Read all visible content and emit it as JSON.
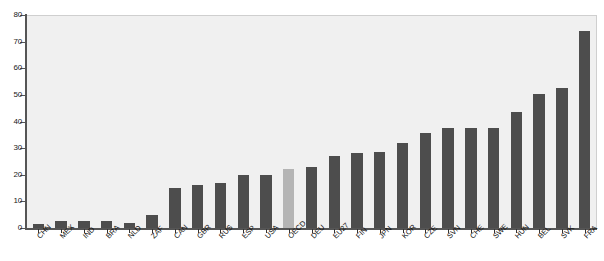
{
  "chart_data": {
    "type": "bar",
    "title": "",
    "subtitle": "",
    "xlabel": "",
    "ylabel": "",
    "ylim": [
      0,
      80
    ],
    "yticks": [
      0,
      10,
      20,
      30,
      40,
      50,
      60,
      70,
      80
    ],
    "grid": false,
    "legend": "none",
    "bar_color": "#4d4d4d",
    "highlight_color": "#b4b4b4",
    "plot_background": "#f0f0f0",
    "highlight_category": "OECD",
    "categories": [
      "CHN",
      "MEX",
      "IND",
      "BRA",
      "NLD",
      "ZAF",
      "CAN",
      "GBR",
      "RUS",
      "ESP",
      "USA",
      "OECD",
      "DEU",
      "EU27",
      "FIN",
      "JPN",
      "KOR",
      "CZE",
      "SVN",
      "CHE",
      "SWE",
      "HUN",
      "BEL",
      "SVK",
      "FRA"
    ],
    "values": [
      1.5,
      2.5,
      2.5,
      2.5,
      2,
      5,
      15,
      16,
      17,
      20,
      20,
      22,
      23,
      27,
      28,
      28.5,
      32,
      35.5,
      37.5,
      37.5,
      37.5,
      43.5,
      50.5,
      52.5,
      74
    ]
  },
  "axis": {
    "y_tick_labels": [
      "0",
      "10",
      "20",
      "30",
      "40",
      "50",
      "60",
      "70",
      "80"
    ]
  }
}
